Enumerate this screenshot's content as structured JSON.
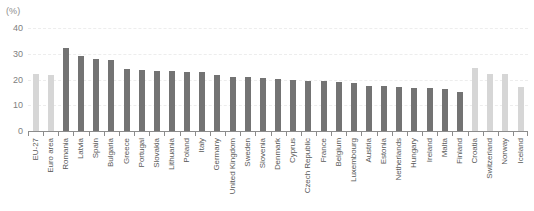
{
  "chart_data": {
    "type": "bar",
    "title": "",
    "unit_label": "(%)",
    "xlabel": "",
    "ylabel": "",
    "ylim": [
      0,
      40
    ],
    "yticks": [
      0,
      10,
      20,
      30,
      40
    ],
    "grid": true,
    "legend": "none",
    "colors": {
      "aggregate_bar": "#d6d6d6",
      "country_bar": "#737373",
      "axis": "#8c8c8c",
      "gridline": "#ededed",
      "label_text": "#595959"
    },
    "categories": [
      "EU-27",
      "Euro area",
      "Romania",
      "Latvia",
      "Spain",
      "Bulgaria",
      "Greece",
      "Portugal",
      "Slovakia",
      "Lithuania",
      "Poland",
      "Italy",
      "Germany",
      "United Kingdom",
      "Sweden",
      "Slovenia",
      "Denmark",
      "Cyprus",
      "Czech Republic",
      "France",
      "Belgium",
      "Luxembourg",
      "Austria",
      "Estonia",
      "Netherlands",
      "Hungary",
      "Ireland",
      "Malta",
      "Finland",
      "Croatia",
      "Switzerland",
      "Norway",
      "Iceland"
    ],
    "values": [
      22.0,
      21.8,
      32.2,
      29.0,
      27.8,
      27.4,
      24.2,
      23.6,
      23.4,
      23.2,
      23.0,
      22.8,
      21.6,
      21.0,
      20.8,
      20.6,
      20.2,
      19.8,
      19.6,
      19.4,
      19.0,
      18.8,
      17.6,
      17.4,
      17.0,
      16.8,
      16.6,
      16.4,
      15.2,
      24.6,
      22.2,
      22.0,
      17.0
    ],
    "series_shading": [
      "light",
      "light",
      "dark",
      "dark",
      "dark",
      "dark",
      "dark",
      "dark",
      "dark",
      "dark",
      "dark",
      "dark",
      "dark",
      "dark",
      "dark",
      "dark",
      "dark",
      "dark",
      "dark",
      "dark",
      "dark",
      "dark",
      "dark",
      "dark",
      "dark",
      "dark",
      "dark",
      "dark",
      "dark",
      "light",
      "light",
      "light",
      "light"
    ]
  }
}
